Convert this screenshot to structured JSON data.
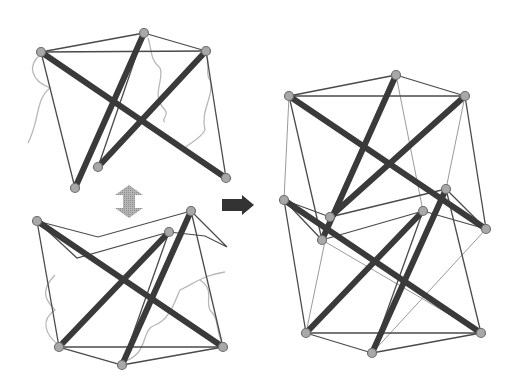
{
  "figure": {
    "colors": {
      "strut": "#3a3a3a",
      "cable": "#4a4a4a",
      "cable_light": "#9a9a9a",
      "wire": "#b8b8b8",
      "node_fill": "#a8a8a8",
      "node_stroke": "#6e6e6e",
      "stack_arrow": "#aaaaaa",
      "result_arrow": "#333333"
    },
    "arrows": [
      {
        "name": "stack-arrow",
        "type": "double-vertical",
        "x": 115,
        "y1": 186,
        "y2": 218,
        "width": 28
      },
      {
        "name": "result-arrow",
        "type": "right",
        "x1": 222,
        "x2": 254,
        "y": 205,
        "height": 18
      }
    ],
    "modules": {
      "top_module": {
        "nodes": {
          "A": [
            41,
            52
          ],
          "B": [
            144,
            33
          ],
          "C": [
            206,
            51
          ],
          "D": [
            75,
            188
          ],
          "E": [
            98,
            167
          ],
          "F": [
            226,
            178
          ]
        },
        "struts": [
          [
            "A",
            "F"
          ],
          [
            "B",
            "D"
          ],
          [
            "C",
            "E"
          ]
        ],
        "cables": [
          [
            "A",
            "B"
          ],
          [
            "B",
            "C"
          ],
          [
            "A",
            "C"
          ],
          [
            "A",
            "D"
          ],
          [
            "C",
            "F"
          ],
          [
            "B",
            "E"
          ]
        ],
        "wires": [
          "M 40 55 C 28 65, 30 80, 50 88 C 35 100, 40 120, 28 143",
          "M 148 38 C 152 50, 150 60, 160 68 C 165 80, 150 95, 165 110 C 170 115, 160 120, 165 122",
          "M 207 56 C 210 65, 205 75, 210 80 C 215 95, 200 110, 205 130 C 200 140, 185 145, 183 150"
        ]
      },
      "bottom_module": {
        "nodes": {
          "G": [
            37,
            221
          ],
          "H": [
            191,
            211
          ],
          "I": [
            169,
            232
          ],
          "J": [
            59,
            347
          ],
          "K": [
            122,
            365
          ],
          "L": [
            223,
            347
          ]
        },
        "struts": [
          [
            "G",
            "L"
          ],
          [
            "I",
            "J"
          ],
          [
            "H",
            "K"
          ]
        ],
        "cables": [
          [
            "J",
            "K"
          ],
          [
            "K",
            "L"
          ],
          [
            "J",
            "L"
          ],
          [
            "G",
            "J"
          ],
          [
            "H",
            "L"
          ],
          [
            "I",
            "K"
          ]
        ],
        "zigzags": [
          [
            [
              37,
              221
            ],
            [
              98,
              237
            ],
            [
              191,
              211
            ]
          ],
          [
            [
              37,
              221
            ],
            [
              77,
              258
            ],
            [
              169,
              232
            ]
          ],
          [
            [
              191,
              211
            ],
            [
              227,
              247
            ],
            [
              205,
              236
            ],
            [
              169,
              232
            ]
          ]
        ],
        "wires": [
          "M 59 345 C 45 335, 40 320, 55 310 C 45 300, 40 290, 55 275",
          "M 122 362 C 150 355, 140 330, 155 325 C 170 320, 175 300, 180 290 C 200 280, 205 275, 225 272",
          "M 223 345 C 215 330, 220 320, 210 310 C 205 300, 215 290, 200 280"
        ]
      },
      "stacked_tower": {
        "nodes": {
          "P1": [
            289,
            96
          ],
          "P2": [
            396,
            75
          ],
          "P3": [
            465,
            96
          ],
          "M1": [
            284,
            200
          ],
          "M2": [
            330,
            217
          ],
          "M3": [
            446,
            189
          ],
          "M4": [
            423,
            211
          ],
          "M5": [
            486,
            229
          ],
          "M6": [
            322,
            240
          ],
          "Q1": [
            306,
            333
          ],
          "Q2": [
            372,
            353
          ],
          "Q3": [
            481,
            333
          ]
        },
        "struts": [
          [
            "P1",
            "M5"
          ],
          [
            "P2",
            "M6"
          ],
          [
            "P3",
            "M2"
          ],
          [
            "M1",
            "Q3"
          ],
          [
            "M4",
            "Q1"
          ],
          [
            "M3",
            "Q2"
          ]
        ],
        "cables": [
          [
            "P1",
            "P2"
          ],
          [
            "P2",
            "P3"
          ],
          [
            "P1",
            "P3"
          ],
          [
            "P1",
            "M6"
          ],
          [
            "P3",
            "M5"
          ],
          [
            "P2",
            "M2"
          ],
          [
            "M2",
            "M3"
          ],
          [
            "M6",
            "M4"
          ],
          [
            "M1",
            "M2"
          ],
          [
            "M3",
            "M5"
          ],
          [
            "M4",
            "M5"
          ],
          [
            "M1",
            "M6"
          ],
          [
            "Q1",
            "Q2"
          ],
          [
            "Q2",
            "Q3"
          ],
          [
            "Q1",
            "Q3"
          ],
          [
            "M1",
            "Q1"
          ],
          [
            "M3",
            "Q3"
          ],
          [
            "M4",
            "Q2"
          ]
        ],
        "light_cables": [
          [
            "P1",
            "M1"
          ],
          [
            "P2",
            "M4"
          ],
          [
            "P3",
            "M3"
          ],
          [
            "M6",
            "Q3"
          ],
          [
            "M5",
            "Q2"
          ],
          [
            "M2",
            "Q1"
          ]
        ]
      }
    }
  }
}
